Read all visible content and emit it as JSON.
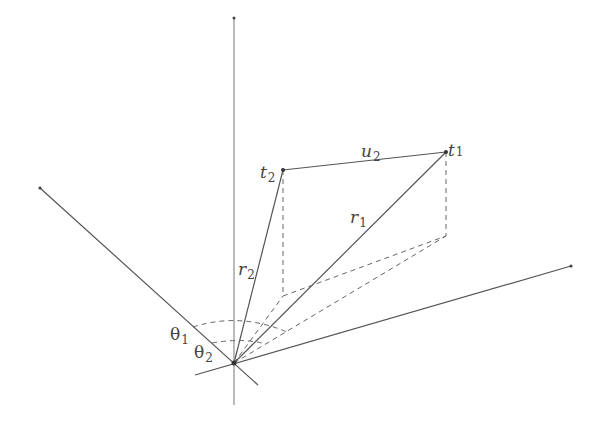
{
  "diagram": {
    "type": "3d-vector-geometry",
    "colors": {
      "line": "#555555",
      "dashed": "#666666",
      "text": "#444444",
      "background": "#ffffff"
    },
    "origin": {
      "x": 234,
      "y": 363
    },
    "axes": [
      {
        "name": "vertical-axis",
        "x1": 234,
        "y1": 405,
        "x2": 234,
        "y2": 18
      },
      {
        "name": "left-axis",
        "x1": 258,
        "y1": 385,
        "x2": 40,
        "y2": 188
      },
      {
        "name": "right-axis",
        "x1": 195,
        "y1": 375,
        "x2": 571,
        "y2": 266
      }
    ],
    "points": {
      "t1": {
        "x": 446,
        "y": 152,
        "label": "t",
        "sub": "1"
      },
      "t2": {
        "x": 283,
        "y": 170,
        "label": "t",
        "sub": "2"
      },
      "t1_foot": {
        "x": 446,
        "y": 236
      },
      "t2_foot": {
        "x": 283,
        "y": 296
      }
    },
    "labels": {
      "u2": {
        "main": "u",
        "sub": "2"
      },
      "r1": {
        "main": "r",
        "sub": "1"
      },
      "r2": {
        "main": "r",
        "sub": "2"
      },
      "theta1": {
        "main": "θ",
        "sub": "1"
      },
      "theta2": {
        "main": "θ",
        "sub": "2"
      }
    }
  }
}
